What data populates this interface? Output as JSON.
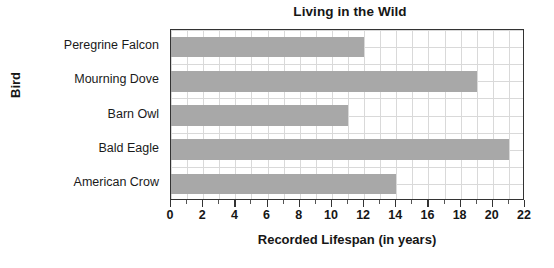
{
  "chart_data": {
    "type": "bar",
    "orientation": "horizontal",
    "title": "Living in the Wild",
    "xlabel": "Recorded Lifespan (in years)",
    "ylabel": "Bird",
    "categories": [
      "Peregrine Falcon",
      "Mourning Dove",
      "Barn Owl",
      "Bald Eagle",
      "American Crow"
    ],
    "values": [
      12,
      19,
      11,
      21,
      14
    ],
    "xlim": [
      0,
      22
    ],
    "xtick_step": 2,
    "xminor_step": 1,
    "xticks": [
      "0",
      "2",
      "4",
      "6",
      "8",
      "10",
      "12",
      "14",
      "16",
      "18",
      "20",
      "22"
    ],
    "grid": true,
    "legend": false,
    "bar_color": "#a8a8a8",
    "axis_color": "#333333",
    "grid_color": "#d9d9d9",
    "background": "#ffffff"
  }
}
